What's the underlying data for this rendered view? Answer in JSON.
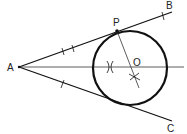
{
  "diagram": {
    "type": "geometry-construction",
    "labels": {
      "A": "A",
      "B": "B",
      "C": "C",
      "P": "P",
      "O": "O"
    },
    "points": {
      "A": [
        19,
        67
      ],
      "B": [
        172,
        12
      ],
      "C": [
        172,
        121
      ],
      "P": [
        117,
        31
      ],
      "O": [
        130,
        67
      ]
    },
    "circle": {
      "center": [
        130,
        67
      ],
      "radius": 37
    },
    "colors": {
      "stroke": "#111111",
      "background": "#ffffff"
    }
  }
}
